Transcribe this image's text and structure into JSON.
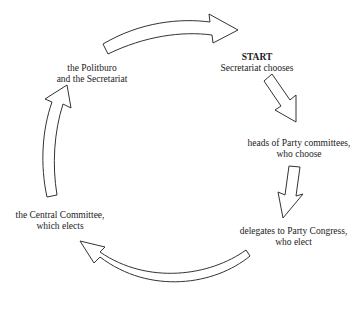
{
  "diagram": {
    "type": "cycle",
    "nodes": [
      {
        "id": "start",
        "title": "START",
        "line1": "Secretariat chooses",
        "line2": ""
      },
      {
        "id": "heads",
        "title": "",
        "line1": "heads of Party committees,",
        "line2": "who choose"
      },
      {
        "id": "delegates",
        "title": "",
        "line1": "delegates to Party Congress,",
        "line2": "who elect"
      },
      {
        "id": "central",
        "title": "",
        "line1": "the Central Committee,",
        "line2": "which elects"
      },
      {
        "id": "politburo",
        "title": "",
        "line1": "the Politburo",
        "line2": "and the Secretariat"
      }
    ],
    "edges": [
      {
        "from": "politburo",
        "to": "start"
      },
      {
        "from": "start",
        "to": "heads"
      },
      {
        "from": "heads",
        "to": "delegates"
      },
      {
        "from": "delegates",
        "to": "central"
      },
      {
        "from": "central",
        "to": "politburo"
      }
    ],
    "colors": {
      "stroke": "#333333",
      "fill": "#ffffff",
      "text": "#222222"
    }
  }
}
